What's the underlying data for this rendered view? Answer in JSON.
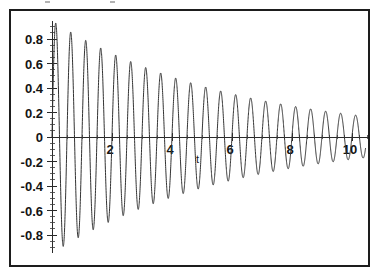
{
  "figure": {
    "kind": "plot-figure",
    "background_color": "#ffffff",
    "frame_color": "#1d1d1d",
    "curve_color": "#333333",
    "axis_color": "#2a2a2a"
  },
  "chart_data": {
    "type": "line",
    "title": "",
    "subtitle": "",
    "xlabel": "t",
    "ylabel": "",
    "grid": false,
    "legend": false,
    "legend_position": "none",
    "xlim": [
      -0.15,
      10.6
    ],
    "ylim": [
      -0.95,
      0.95
    ],
    "x_ticks": [
      2,
      4,
      6,
      8,
      10
    ],
    "x_tick_labels": [
      "2",
      "4",
      "6",
      "8",
      "10"
    ],
    "x_minor_tick_step": 0.25,
    "y_ticks": [
      -0.8,
      -0.6,
      -0.4,
      -0.2,
      0,
      0.2,
      0.4,
      0.6,
      0.8
    ],
    "y_tick_labels": [
      "-0.8",
      "-0.6",
      "-0.4",
      "-0.2",
      "0",
      "0.2",
      "0.4",
      "0.6",
      "0.8"
    ],
    "y_minor_tick_step": 0.05,
    "series": [
      {
        "name": "damped oscillation",
        "color": "#333333",
        "equation_form": "A*exp(-k*t)*sin(w*t)",
        "amplitude": 0.95,
        "decay_rate": 0.165,
        "angular_frequency": 12.57,
        "phase": 0,
        "t_start": 0,
        "t_end": 10.45,
        "peaks_t": [
          0.35,
          0.85,
          1.35,
          1.85,
          2.35,
          2.85,
          3.35,
          3.85,
          4.35,
          4.85,
          5.35,
          5.85,
          6.35,
          6.85,
          7.35,
          7.85,
          8.35,
          8.85,
          9.35,
          9.85
        ],
        "peaks_y": [
          0.86,
          0.79,
          0.74,
          0.68,
          0.63,
          0.58,
          0.53,
          0.48,
          0.44,
          0.41,
          0.38,
          0.35,
          0.32,
          0.29,
          0.27,
          0.25,
          0.23,
          0.21,
          0.19,
          0.18
        ],
        "troughs_t": [
          0.6,
          1.1,
          1.6,
          2.1,
          2.6,
          3.1,
          3.6,
          4.1,
          4.6,
          5.1,
          5.6,
          6.1,
          6.6,
          7.1,
          7.6,
          8.1,
          8.6,
          9.1,
          9.6,
          10.1
        ],
        "troughs_y": [
          -0.88,
          -0.81,
          -0.75,
          -0.69,
          -0.64,
          -0.59,
          -0.54,
          -0.5,
          -0.46,
          -0.42,
          -0.39,
          -0.36,
          -0.33,
          -0.3,
          -0.28,
          -0.26,
          -0.24,
          -0.22,
          -0.2,
          -0.19
        ]
      }
    ]
  }
}
